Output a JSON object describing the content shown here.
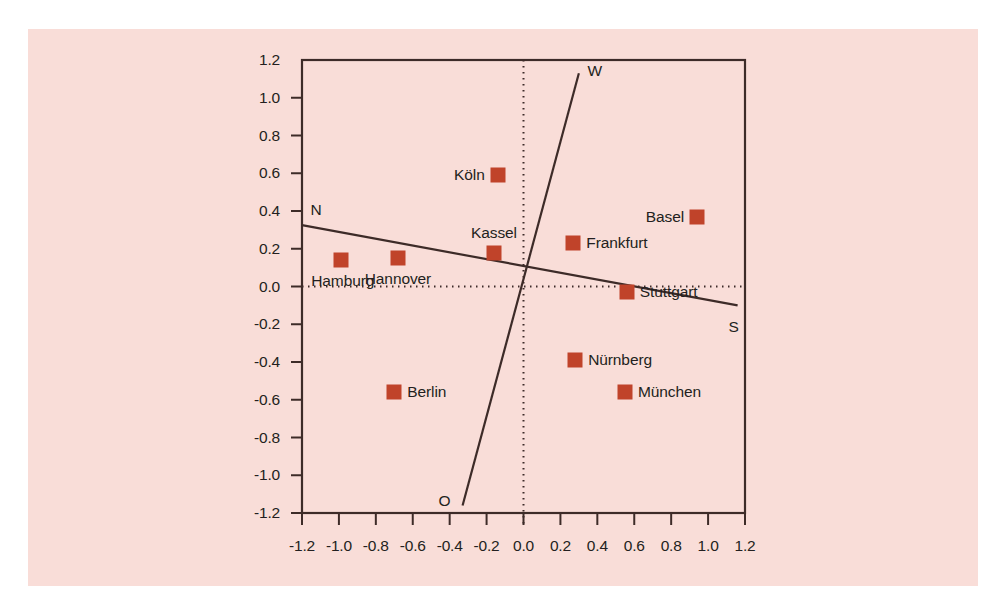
{
  "figure": {
    "background_color": "#ffffff",
    "panel_color": "#f9ddd8",
    "axis_color": "#3d2b28",
    "marker_color": "#c0432a",
    "text_color": "#231f20"
  },
  "chart_data": {
    "type": "scatter",
    "title": "",
    "subtitle": "",
    "xlabel": "",
    "ylabel": "",
    "xlim": [
      -1.2,
      1.2
    ],
    "ylim": [
      -1.2,
      1.2
    ],
    "grid": false,
    "legend": "none",
    "xticks": [
      "-1.2",
      "-1.0",
      "-0.8",
      "-0.6",
      "-0.4",
      "-0.2",
      "0.0",
      "0.2",
      "0.4",
      "0.6",
      "0.8",
      "1.0",
      "1.2"
    ],
    "xtick_values": [
      -1.2,
      -1.0,
      -0.8,
      -0.6,
      -0.4,
      -0.2,
      0.0,
      0.2,
      0.4,
      0.6,
      0.8,
      1.0,
      1.2
    ],
    "yticks": [
      "1.2",
      "1.0",
      "0.8",
      "0.6",
      "0.4",
      "0.2",
      "0.0",
      "-0.2",
      "-0.4",
      "-0.6",
      "-0.8",
      "-1.0",
      "-1.2"
    ],
    "ytick_values": [
      1.2,
      1.0,
      0.8,
      0.6,
      0.4,
      0.2,
      0.0,
      -0.2,
      -0.4,
      -0.6,
      -0.8,
      -1.0,
      -1.2
    ],
    "reference_lines": [
      {
        "name": "zero-vertical",
        "style": "dotted",
        "x": 0.0
      },
      {
        "name": "zero-horizontal",
        "style": "dotted",
        "y": 0.0
      }
    ],
    "direction_axes": [
      {
        "name": "N-S",
        "label_start": "N",
        "label_end": "S",
        "start": [
          -1.2,
          0.325
        ],
        "end": [
          1.16,
          -0.1
        ]
      },
      {
        "name": "W-O",
        "label_start": "W",
        "label_end": "O",
        "start": [
          0.3,
          1.13
        ],
        "end": [
          -0.33,
          -1.16
        ]
      }
    ],
    "points": [
      {
        "label": "Hamburg",
        "x": -0.99,
        "y": 0.14,
        "label_pos": "below-left"
      },
      {
        "label": "Hannover",
        "x": -0.68,
        "y": 0.15,
        "label_pos": "below-center"
      },
      {
        "label": "Kassel",
        "x": -0.16,
        "y": 0.18,
        "label_pos": "above-center"
      },
      {
        "label": "Köln",
        "x": -0.14,
        "y": 0.59,
        "label_pos": "left"
      },
      {
        "label": "Berlin",
        "x": -0.7,
        "y": -0.56,
        "label_pos": "right"
      },
      {
        "label": "Basel",
        "x": 0.94,
        "y": 0.37,
        "label_pos": "left"
      },
      {
        "label": "Frankfurt",
        "x": 0.27,
        "y": 0.23,
        "label_pos": "right"
      },
      {
        "label": "Stuttgart",
        "x": 0.56,
        "y": -0.03,
        "label_pos": "right"
      },
      {
        "label": "Nürnberg",
        "x": 0.28,
        "y": -0.39,
        "label_pos": "right"
      },
      {
        "label": "München",
        "x": 0.55,
        "y": -0.56,
        "label_pos": "right"
      }
    ]
  }
}
